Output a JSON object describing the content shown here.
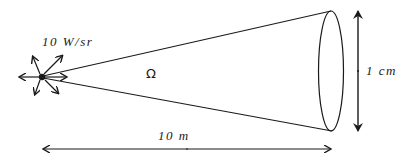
{
  "diagram": {
    "source": {
      "intensity_label": "10 W/sr",
      "position": [
        42,
        77
      ]
    },
    "solid_angle_label": "Ω",
    "aperture": {
      "diameter_label": "1 cm",
      "center": [
        331,
        71
      ]
    },
    "distance_label": "10 m",
    "colors": {
      "stroke": "#1a1a1a",
      "background": "#ffffff"
    }
  }
}
